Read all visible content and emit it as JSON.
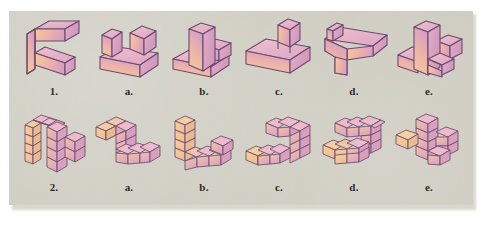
{
  "figure": {
    "kind": "spatial-reasoning-multiple-choice",
    "background_color": "#cfcdc1",
    "border_color": "#ffffff",
    "outline_color": "#6b4a6e",
    "fill_light": "#f3c89a",
    "fill_mid": "#efb9a3",
    "fill_dark": "#d9a3bd",
    "fill_top": "#e7b6c9",
    "rows": [
      {
        "id": "row-1",
        "kind": "solid-block-shapes",
        "items": [
          {
            "label": "1.",
            "name": "prompt-shape-1",
            "shape": "step-block-prompt"
          },
          {
            "label": "a.",
            "name": "option-1a",
            "shape": "two-posts-on-slab"
          },
          {
            "label": "b.",
            "name": "option-1b",
            "shape": "tall-post-with-step"
          },
          {
            "label": "c.",
            "name": "option-1c",
            "shape": "slab-with-single-post"
          },
          {
            "label": "d.",
            "name": "option-1d",
            "shape": "flat-tee-with-notch"
          },
          {
            "label": "e.",
            "name": "option-1e",
            "shape": "u-block-with-post"
          }
        ]
      },
      {
        "id": "row-2",
        "kind": "unit-cube-assemblies",
        "items": [
          {
            "label": "2.",
            "name": "prompt-shape-2",
            "shape": "cube-arch-assembly",
            "cube_count": 14
          },
          {
            "label": "a.",
            "name": "option-2a",
            "shape": "cube-zigzag-low",
            "cube_count": 9
          },
          {
            "label": "b.",
            "name": "option-2b",
            "shape": "cube-l-tower",
            "cube_count": 11
          },
          {
            "label": "c.",
            "name": "option-2c",
            "shape": "cube-hook-right",
            "cube_count": 11
          },
          {
            "label": "d.",
            "name": "option-2d",
            "shape": "cube-c-shape",
            "cube_count": 13
          },
          {
            "label": "e.",
            "name": "option-2e",
            "shape": "cube-cross-tower",
            "cube_count": 12
          }
        ]
      }
    ]
  }
}
